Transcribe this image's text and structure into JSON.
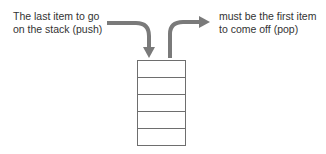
{
  "diagram": {
    "push_label": {
      "line1": "The last item to go",
      "line2": "on the stack (push)"
    },
    "pop_label": {
      "line1": "must be the first item",
      "line2": "to come off (pop)"
    },
    "stack": {
      "rows": 5
    },
    "colors": {
      "arrow": "#7a7a7a",
      "box_stroke": "#6e6e6e",
      "text": "#333333"
    }
  }
}
